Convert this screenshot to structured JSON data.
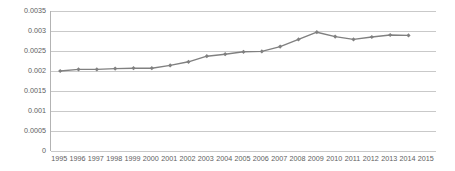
{
  "chart_data": {
    "type": "line",
    "title": "",
    "subtitle": "",
    "xlabel": "",
    "ylabel": "",
    "grid": true,
    "legend": false,
    "legend_position": "none",
    "series_color": "#808080",
    "marker": "diamond",
    "categories": [
      "1995",
      "1996",
      "1997",
      "1998",
      "1999",
      "2000",
      "2001",
      "2002",
      "2003",
      "2004",
      "2005",
      "2006",
      "2007",
      "2008",
      "2009",
      "2010",
      "2011",
      "2012",
      "2013",
      "2014",
      "2015"
    ],
    "x_tick_labels": [
      "1995",
      "1996",
      "1997",
      "1998",
      "1999",
      "2000",
      "2001",
      "2002",
      "2003",
      "2004",
      "2005",
      "2006",
      "2007",
      "2008",
      "2009",
      "2010",
      "2011",
      "2012",
      "2013",
      "2014",
      "2015"
    ],
    "y_tick_labels": [
      "0",
      "0.0005",
      "0.001",
      "0.0015",
      "0.002",
      "0.0025",
      "0.003",
      "0.0035"
    ],
    "y_tick_values": [
      0,
      0.0005,
      0.001,
      0.0015,
      0.002,
      0.0025,
      0.003,
      0.0035
    ],
    "ylim": [
      0,
      0.0035
    ],
    "series": [
      {
        "name": "Series 1",
        "values": [
          0.002,
          0.00204,
          0.00204,
          0.00206,
          0.00207,
          0.00207,
          0.00214,
          0.00223,
          0.00237,
          0.00242,
          0.00248,
          0.00249,
          0.00261,
          0.00279,
          0.00297,
          0.00286,
          0.00279,
          0.00285,
          0.0029,
          0.00289,
          null
        ]
      }
    ]
  }
}
